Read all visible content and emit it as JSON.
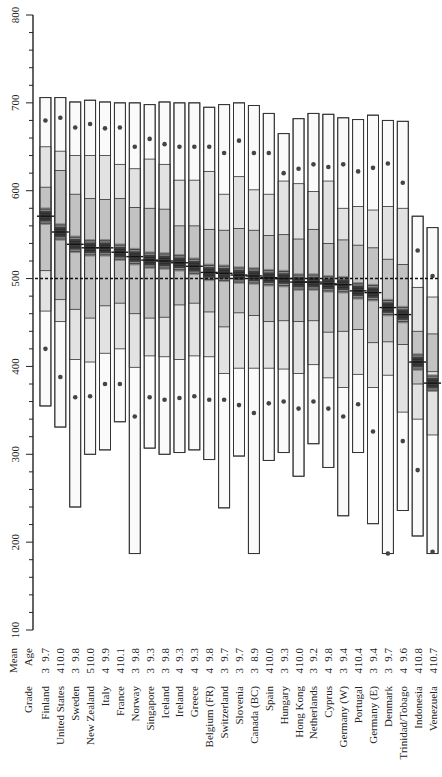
{
  "chart_data": {
    "type": "box",
    "orientation": "rotated-90",
    "title": "",
    "ylabel": "",
    "yaxis": {
      "min": 100,
      "max": 800,
      "ticks": [
        100,
        200,
        300,
        400,
        500,
        600,
        700,
        800
      ],
      "minor_step": 20
    },
    "reference_line": {
      "value": 500,
      "style": "dotted"
    },
    "header": {
      "grade": "Grade",
      "mean": "Mean",
      "age": "Age"
    },
    "band_legend_note": "Boxes show 5th, 10th, 25th, 75th, 90th, 95th percentiles; dark band = 95% CI around mean; dot marks 5th/95th outer band",
    "categories": [
      "Finland",
      "United States",
      "Sweden",
      "New Zealand",
      "Italy",
      "France",
      "Norway",
      "Singapore",
      "Iceland",
      "Ireland",
      "Greece",
      "Belgium (FR)",
      "Switzerland",
      "Slovenia",
      "Canada (BC)",
      "Spain",
      "Hungary",
      "Hong Kong",
      "Netherlands",
      "Cyprus",
      "Germany (W)",
      "Portugal",
      "Germany (E)",
      "Denmark",
      "Trinidad/Tobago",
      "Indonesia",
      "Venezuela"
    ],
    "grade": [
      3,
      4,
      3,
      5,
      4,
      4,
      3,
      3,
      3,
      4,
      4,
      4,
      3,
      3,
      3,
      4,
      3,
      4,
      3,
      4,
      3,
      4,
      3,
      3,
      4,
      4,
      4
    ],
    "mean_age": [
      "9.7",
      "10.0",
      "9.8",
      "10.0",
      "9.9",
      "10.1",
      "9.8",
      "9.3",
      "9.8",
      "9.3",
      "9.3",
      "9.8",
      "9.7",
      "9.7",
      "8.9",
      "10.0",
      "9.3",
      "10.0",
      "9.2",
      "9.8",
      "9.4",
      "10.4",
      "9.4",
      "9.7",
      "9.6",
      "10.8",
      "10.7"
    ],
    "series": [
      {
        "name": "min",
        "values": [
          355,
          331,
          240,
          300,
          305,
          337,
          187,
          307,
          300,
          302,
          305,
          294,
          239,
          298,
          187,
          293,
          302,
          275,
          312,
          285,
          230,
          302,
          221,
          187,
          236,
          207,
          187
        ]
      },
      {
        "name": "p5_dot",
        "values": [
          420,
          388,
          365,
          366,
          380,
          380,
          343,
          365,
          362,
          364,
          366,
          362,
          362,
          356,
          347,
          358,
          360,
          352,
          360,
          352,
          343,
          357,
          326,
          187,
          315,
          282,
          189
        ]
      },
      {
        "name": "p10",
        "values": [
          463,
          451,
          408,
          405,
          415,
          420,
          399,
          412,
          411,
          408,
          412,
          411,
          392,
          398,
          398,
          398,
          397,
          392,
          402,
          387,
          376,
          391,
          376,
          390,
          348,
          340,
          322
        ]
      },
      {
        "name": "p25",
        "values": [
          509,
          476,
          465,
          455,
          469,
          472,
          460,
          455,
          456,
          470,
          472,
          462,
          445,
          461,
          458,
          451,
          452,
          451,
          452,
          439,
          440,
          442,
          427,
          428,
          425,
          380,
          394
        ]
      },
      {
        "name": "mean",
        "values": [
          571,
          553,
          539,
          535,
          535,
          530,
          525,
          521,
          520,
          518,
          514,
          507,
          506,
          504,
          503,
          501,
          500,
          496,
          496,
          494,
          493,
          486,
          484,
          467,
          459,
          405,
          381
        ]
      },
      {
        "name": "p75",
        "values": [
          604,
          623,
          596,
          591,
          590,
          591,
          581,
          580,
          579,
          560,
          560,
          556,
          555,
          557,
          555,
          549,
          550,
          545,
          556,
          540,
          544,
          538,
          535,
          522,
          516,
          440,
          437
        ]
      },
      {
        "name": "p90",
        "values": [
          650,
          645,
          640,
          640,
          640,
          630,
          625,
          636,
          630,
          612,
          612,
          622,
          596,
          616,
          601,
          596,
          611,
          608,
          599,
          611,
          580,
          582,
          578,
          582,
          580,
          490,
          479
        ]
      },
      {
        "name": "p95_dot",
        "values": [
          680,
          683,
          672,
          676,
          671,
          672,
          650,
          659,
          653,
          650,
          650,
          650,
          643,
          657,
          643,
          643,
          620,
          625,
          630,
          627,
          630,
          622,
          626,
          631,
          609,
          532,
          503
        ]
      },
      {
        "name": "max",
        "values": [
          706,
          706,
          701,
          703,
          701,
          700,
          700,
          698,
          701,
          700,
          700,
          695,
          698,
          700,
          697,
          688,
          665,
          682,
          688,
          687,
          683,
          681,
          686,
          680,
          679,
          571,
          558
        ]
      }
    ]
  },
  "labels": {
    "header_grade": "Grade",
    "header_mean": "Mean",
    "header_age": "Age"
  }
}
